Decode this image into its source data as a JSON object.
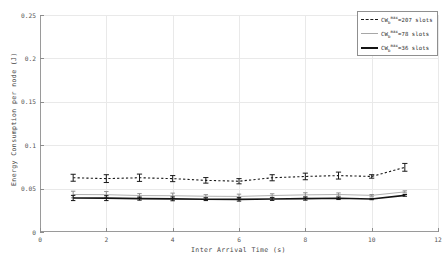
{
  "chart_data": {
    "type": "line",
    "title": "",
    "xlabel": "Inter Arrival Time (s)",
    "ylabel": "Energy Consumption per node (J)",
    "xlim": [
      0,
      12
    ],
    "ylim": [
      0,
      0.25
    ],
    "xticks": [
      0,
      2,
      4,
      6,
      8,
      10,
      12
    ],
    "xtick_labels": [
      "0",
      "2",
      "4",
      "6",
      "8",
      "10",
      "12"
    ],
    "yticks": [
      0,
      0.05,
      0.1,
      0.15,
      0.2,
      0.25
    ],
    "ytick_labels": [
      "0",
      "0.05",
      "0.1",
      "0.15",
      "0.2",
      "0.25"
    ],
    "grid": true,
    "legend_position": "top-right",
    "x": [
      1,
      2,
      3,
      4,
      5,
      6,
      7,
      8,
      9,
      10,
      11
    ],
    "series": [
      {
        "name": "CW_b^max=207 slots",
        "label_base": "CW",
        "label_sub": "b",
        "label_sup": "max",
        "label_tail": "=207 slots",
        "style": "dashed",
        "color": "#1a1a1a",
        "values": [
          0.0625,
          0.0615,
          0.0625,
          0.0615,
          0.0595,
          0.0585,
          0.0625,
          0.064,
          0.065,
          0.064,
          0.0745
        ],
        "errors": [
          0.004,
          0.0045,
          0.0042,
          0.0035,
          0.0032,
          0.003,
          0.0035,
          0.0038,
          0.004,
          0.002,
          0.0045
        ]
      },
      {
        "name": "CW_b^max=78 slots",
        "label_base": "CW",
        "label_sub": "b",
        "label_sup": "max",
        "label_tail": "=78 slots",
        "style": "thin",
        "color": "#a7a7a7",
        "values": [
          0.0432,
          0.043,
          0.042,
          0.0418,
          0.0412,
          0.041,
          0.042,
          0.0428,
          0.0432,
          0.0422,
          0.0462
        ],
        "errors": [
          0.0038,
          0.0036,
          0.0022,
          0.003,
          0.0018,
          0.0026,
          0.002,
          0.0024,
          0.0018,
          0.001,
          0.0012
        ]
      },
      {
        "name": "CW_b^max=36 slots",
        "label_base": "CW",
        "label_sub": "b",
        "label_sup": "max",
        "label_tail": "=36 slots",
        "style": "thick",
        "color": "#141414",
        "values": [
          0.0392,
          0.039,
          0.0385,
          0.0382,
          0.0378,
          0.0376,
          0.038,
          0.0385,
          0.0388,
          0.038,
          0.0422
        ],
        "errors": [
          0.003,
          0.0028,
          0.0018,
          0.0022,
          0.0016,
          0.002,
          0.0016,
          0.0018,
          0.0014,
          0.0008,
          0.001
        ]
      }
    ]
  }
}
